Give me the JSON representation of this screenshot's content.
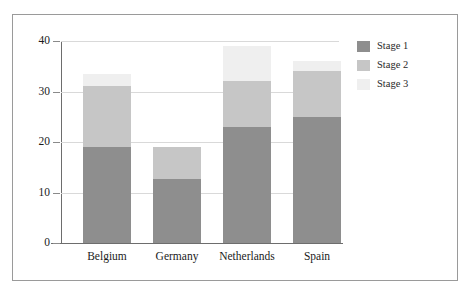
{
  "chart_data": {
    "type": "bar",
    "subtype": "stacked",
    "title": "",
    "xlabel": "",
    "ylabel": "",
    "categories": [
      "Belgium",
      "Germany",
      "Netherlands",
      "Spain"
    ],
    "ylim": [
      0,
      40
    ],
    "yticks": [
      0,
      10,
      20,
      30,
      40
    ],
    "ytick_labels": [
      "0",
      "10",
      "20",
      "30",
      "40"
    ],
    "grid": true,
    "legend_position": "right",
    "series": [
      {
        "name": "Stage 1",
        "color": "#8e8e8e",
        "values": [
          19,
          12.7,
          23,
          25
        ]
      },
      {
        "name": "Stage 2",
        "color": "#c6c6c6",
        "values": [
          12,
          6.3,
          9,
          9
        ]
      },
      {
        "name": "Stage 3",
        "color": "#efefef",
        "values": [
          2.5,
          0,
          7,
          2
        ]
      }
    ],
    "totals": [
      33.5,
      19,
      39,
      36
    ]
  },
  "colors": {
    "frame_border": "#9a9a9a",
    "axis": "#6d6d6d",
    "gridline": "#d9d9d9",
    "background": "#ffffff",
    "text": "#1b1b1b"
  }
}
